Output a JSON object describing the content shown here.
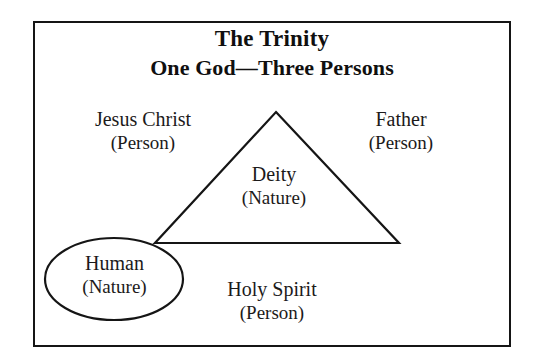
{
  "diagram": {
    "type": "venn-overlap-diagram",
    "title": {
      "line1": "The Trinity",
      "line2": "One God—Three Persons"
    },
    "frame": {
      "stroke_color": "#151515",
      "fill_color": "#ffffff"
    },
    "shapes": [
      {
        "name": "triangle",
        "label_line1": "Deity",
        "label_line2": "(Nature)",
        "stroke_color": "#151515",
        "vertices": [
          [
            276,
            112
          ],
          [
            399,
            243
          ],
          [
            155,
            243
          ]
        ]
      },
      {
        "name": "ellipse",
        "label_line1": "Human",
        "label_line2": "(Nature)",
        "stroke_color": "#151515",
        "center": [
          114,
          279
        ],
        "radius_x": 69,
        "radius_y": 41
      }
    ],
    "labels": [
      {
        "id": "jesus-christ",
        "line1": "Jesus Christ",
        "line2": "(Person)"
      },
      {
        "id": "father",
        "line1": "Father",
        "line2": "(Person)"
      },
      {
        "id": "deity",
        "line1": "Deity",
        "line2": "(Nature)"
      },
      {
        "id": "holy-spirit",
        "line1": "Holy Spirit",
        "line2": "(Person)"
      },
      {
        "id": "human",
        "line1": "Human",
        "line2": "(Nature)"
      }
    ]
  }
}
